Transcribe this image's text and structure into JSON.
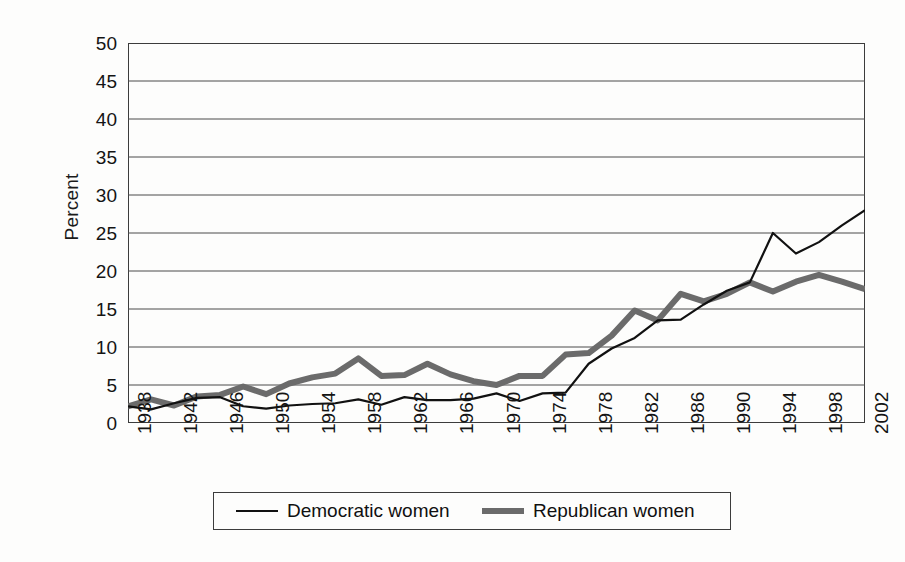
{
  "chart_data": {
    "type": "line",
    "title": "",
    "xlabel": "",
    "ylabel": "Percent",
    "ylim": [
      0,
      50
    ],
    "ytick_step": 5,
    "yticks": [
      "50",
      "45",
      "40",
      "35",
      "30",
      "25",
      "20",
      "15",
      "10",
      "5",
      "0"
    ],
    "xlim": [
      1938,
      2002
    ],
    "xtick_step": 4,
    "xticks": [
      "1938",
      "1942",
      "1946",
      "1950",
      "1954",
      "1958",
      "1962",
      "1966",
      "1970",
      "1974",
      "1978",
      "1982",
      "1986",
      "1990",
      "1994",
      "1998",
      "2002"
    ],
    "grid": "horizontal",
    "legend_position": "below-axes",
    "x": [
      1938,
      1940,
      1942,
      1944,
      1946,
      1948,
      1950,
      1952,
      1954,
      1956,
      1958,
      1960,
      1962,
      1964,
      1966,
      1968,
      1970,
      1972,
      1974,
      1976,
      1978,
      1980,
      1982,
      1984,
      1986,
      1988,
      1990,
      1992,
      1994,
      1996,
      1998,
      2000,
      2002
    ],
    "series": [
      {
        "name": "Democratic women",
        "color": "#111111",
        "style": "thin-solid",
        "values": [
          2.2,
          1.8,
          2.6,
          3.3,
          3.4,
          2.2,
          1.9,
          2.3,
          2.5,
          2.6,
          3.1,
          2.4,
          3.4,
          3.0,
          3.0,
          3.2,
          3.9,
          2.9,
          3.9,
          4.0,
          7.8,
          9.8,
          11.2,
          13.5,
          13.6,
          15.6,
          17.4,
          18.5,
          25.0,
          22.3,
          23.8,
          26.0,
          28.0
        ]
      },
      {
        "name": "Republican women",
        "color": "#6b6b6b",
        "style": "thick-solid",
        "values": [
          2.2,
          3.1,
          2.3,
          3.5,
          3.7,
          4.8,
          3.8,
          5.2,
          6.0,
          6.5,
          8.5,
          6.2,
          6.3,
          7.8,
          6.4,
          5.5,
          5.0,
          6.2,
          6.2,
          9.0,
          9.2,
          11.5,
          14.8,
          13.5,
          17.0,
          16.0,
          17.0,
          18.5,
          17.3,
          18.6,
          19.5,
          18.6,
          17.6
        ]
      }
    ]
  },
  "legend": {
    "items": [
      {
        "label": "Democratic women",
        "swatch": "thin-line-swatch"
      },
      {
        "label": "Republican women",
        "swatch": "thick-line-swatch"
      }
    ]
  },
  "axes": {
    "y_title": "Percent"
  }
}
